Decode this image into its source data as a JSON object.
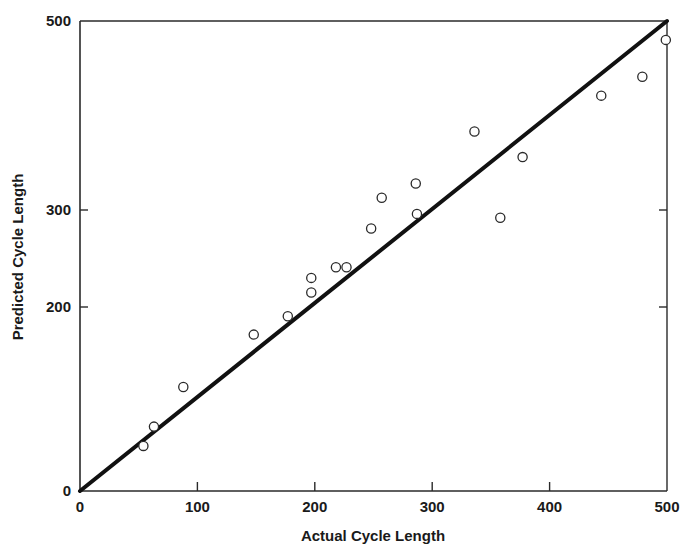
{
  "chart_data": {
    "type": "scatter",
    "title": "",
    "xlabel": "Actual Cycle Length",
    "ylabel": "Predicted Cycle Length",
    "xlim": [
      0,
      500
    ],
    "ylim": [
      0,
      500
    ],
    "x_ticks": [
      0,
      100,
      200,
      300,
      400,
      500
    ],
    "y_ticks": [
      0,
      200,
      300,
      500
    ],
    "grid": false,
    "legend": null,
    "reference_line": {
      "label": "y = x",
      "from": [
        0,
        0
      ],
      "to": [
        500,
        500
      ]
    },
    "series": [
      {
        "name": "observations",
        "marker": "open-circle",
        "points": [
          {
            "x": 54,
            "y": 49
          },
          {
            "x": 63,
            "y": 70
          },
          {
            "x": 88,
            "y": 113
          },
          {
            "x": 148,
            "y": 170
          },
          {
            "x": 177,
            "y": 190
          },
          {
            "x": 197,
            "y": 215
          },
          {
            "x": 197,
            "y": 230
          },
          {
            "x": 218,
            "y": 241
          },
          {
            "x": 227,
            "y": 241
          },
          {
            "x": 248,
            "y": 281
          },
          {
            "x": 257,
            "y": 313
          },
          {
            "x": 286,
            "y": 328
          },
          {
            "x": 287,
            "y": 296
          },
          {
            "x": 336,
            "y": 383
          },
          {
            "x": 358,
            "y": 292
          },
          {
            "x": 377,
            "y": 356
          },
          {
            "x": 444,
            "y": 421
          },
          {
            "x": 479,
            "y": 441
          },
          {
            "x": 499,
            "y": 480
          }
        ]
      }
    ]
  }
}
